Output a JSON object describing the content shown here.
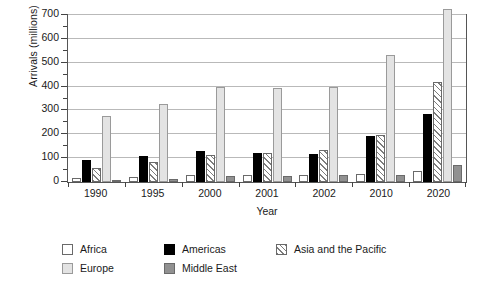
{
  "chart_data": {
    "type": "bar",
    "title": "",
    "xlabel": "Year",
    "ylabel": "Arrivals (millions)",
    "categories": [
      "1990",
      "1995",
      "2000",
      "2001",
      "2002",
      "2010",
      "2020"
    ],
    "ylim": [
      0,
      700
    ],
    "yticks": [
      0,
      100,
      200,
      300,
      400,
      500,
      600,
      700
    ],
    "ytick_labels": [
      "0",
      "100",
      "200",
      "300",
      "400",
      "500",
      "600",
      "700"
    ],
    "minor_yticks": [
      50,
      150,
      250,
      350,
      450,
      550,
      650
    ],
    "grid": true,
    "legend_position": "bottom-left",
    "series": [
      {
        "name": "Africa",
        "key": "africa",
        "swatch": "#ffffff",
        "pattern": "solid",
        "values": [
          15,
          20,
          28,
          29,
          30,
          33,
          47
        ]
      },
      {
        "name": "Americas",
        "key": "americas",
        "swatch": "#000000",
        "pattern": "solid",
        "values": [
          93,
          109,
          128,
          122,
          117,
          190,
          282
        ]
      },
      {
        "name": "Asia and the Pacific",
        "key": "asia",
        "swatch": "#d9d9d9",
        "pattern": "hatch",
        "values": [
          57,
          82,
          111,
          121,
          131,
          195,
          416
        ]
      },
      {
        "name": "Europe",
        "key": "europe",
        "swatch": "#e3e3e3",
        "pattern": "solid",
        "values": [
          275,
          322,
          392,
          390,
          394,
          527,
          717
        ]
      },
      {
        "name": "Middle East",
        "key": "mideast",
        "swatch": "#919191",
        "pattern": "solid",
        "values": [
          10,
          14,
          24,
          23,
          28,
          30,
          69
        ]
      }
    ]
  },
  "legend": {
    "items": [
      {
        "label": "Africa"
      },
      {
        "label": "Americas"
      },
      {
        "label": "Asia and the Pacific"
      },
      {
        "label": "Europe"
      },
      {
        "label": "Middle East"
      }
    ]
  }
}
